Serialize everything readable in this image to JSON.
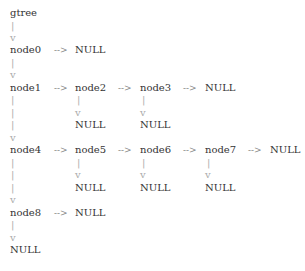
{
  "diagram": {
    "root_label": "gtree",
    "nodes": {
      "n0": "node0",
      "n1": "node1",
      "n2": "node2",
      "n3": "node3",
      "n4": "node4",
      "n5": "node5",
      "n6": "node6",
      "n7": "node7",
      "n8": "node8"
    },
    "null_label": "NULL",
    "arrow_right": "-->",
    "pipe": "|",
    "arrow_down": "v"
  }
}
